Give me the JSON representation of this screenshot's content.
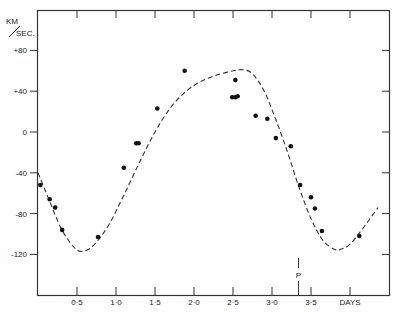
{
  "chart_data": {
    "type": "scatter",
    "title": "",
    "xlabel": "DAYS",
    "ylabel": "KM/SEC.",
    "ylabel_top": "KM",
    "ylabel_bottom": "SEC.",
    "xlim": [
      0,
      4.5
    ],
    "ylim": [
      -140,
      110
    ],
    "grid": false,
    "x_ticks": [
      0.5,
      1.0,
      1.5,
      2.0,
      2.5,
      3.0,
      3.5,
      4.0
    ],
    "x_tick_labels": [
      "0·5",
      "1·0",
      "1·5",
      "2·0",
      "2·5",
      "3·0",
      "3·5",
      "DAYS"
    ],
    "y_ticks": [
      80,
      40,
      0,
      -40,
      -80,
      -120
    ],
    "y_tick_labels": [
      "+80",
      "+40",
      "0",
      "-40",
      "-80",
      "-120"
    ],
    "annotations": [
      {
        "text": "P",
        "x": 3.34,
        "type": "vertical-marker"
      }
    ],
    "series": [
      {
        "name": "Observed radial velocities",
        "style": "points",
        "x": [
          0.03,
          0.15,
          0.22,
          0.31,
          0.77,
          1.1,
          1.26,
          1.29,
          1.53,
          1.88,
          2.49,
          2.53,
          2.53,
          2.56,
          2.79,
          2.94,
          3.05,
          3.24,
          3.36,
          3.5,
          3.55,
          3.64,
          4.12
        ],
        "y": [
          -52,
          -66,
          -74,
          -96,
          -103,
          -35,
          -11,
          -11,
          23,
          60,
          34,
          51,
          34,
          35,
          16,
          13,
          -6,
          -14,
          -52,
          -64,
          -75,
          -97,
          -102
        ]
      },
      {
        "name": "Velocity curve",
        "style": "dashed-line",
        "x": [
          0.0,
          0.15,
          0.3,
          0.45,
          0.55,
          0.7,
          0.9,
          1.1,
          1.3,
          1.5,
          1.7,
          1.9,
          2.1,
          2.3,
          2.5,
          2.63,
          2.75,
          2.9,
          3.05,
          3.2,
          3.35,
          3.5,
          3.65,
          3.8,
          3.88,
          4.0,
          4.15,
          4.36
        ],
        "y": [
          -40,
          -68,
          -95,
          -112,
          -117,
          -112,
          -92,
          -62,
          -30,
          0,
          24,
          40,
          50,
          56,
          60,
          61,
          57,
          40,
          12,
          -20,
          -55,
          -85,
          -106,
          -115,
          -115,
          -110,
          -96,
          -74
        ]
      }
    ]
  }
}
